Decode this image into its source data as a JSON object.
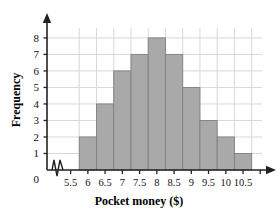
{
  "chart_data": {
    "type": "bar",
    "title": "",
    "xlabel": "Pocket money ($)",
    "ylabel": "Frequency",
    "categories": [
      "6",
      "6.5",
      "7",
      "7.5",
      "8",
      "8.5",
      "9",
      "9.5",
      "10",
      "10.5"
    ],
    "values": [
      2,
      4,
      6,
      7,
      8,
      7,
      5,
      3,
      2,
      1
    ],
    "bin_edges": [
      5.75,
      6.25,
      6.75,
      7.25,
      7.75,
      8.25,
      8.75,
      9.25,
      9.75,
      10.25,
      10.75
    ],
    "bin_width": 0.5,
    "xtick_labels": [
      "5.5",
      "6",
      "6.5",
      "7",
      "7.5",
      "8",
      "8.5",
      "9",
      "9.5",
      "10",
      "10.5"
    ],
    "xtick_values": [
      5.5,
      6,
      6.5,
      7,
      7.5,
      8,
      8.5,
      9,
      9.5,
      10,
      10.5
    ],
    "ytick_labels": [
      "0",
      "1",
      "2",
      "3",
      "4",
      "5",
      "6",
      "7",
      "8"
    ],
    "ytick_values": [
      0,
      1,
      2,
      3,
      4,
      5,
      6,
      7,
      8
    ],
    "xlim": [
      5.25,
      11.05
    ],
    "ylim": [
      0,
      8.6
    ],
    "grid": true,
    "legend": "none",
    "axis_break": true,
    "axis_break_note": "zigzag break on x-axis between 0 and 5.5",
    "bar_color": "#a9a9a9",
    "bar_edge_color": "#808080",
    "grid_color": "#d8d8d8",
    "axis_color": "#222222"
  },
  "axis_labels": {
    "x": "Pocket money ($)",
    "y": "Frequency"
  },
  "origin_label": "0"
}
